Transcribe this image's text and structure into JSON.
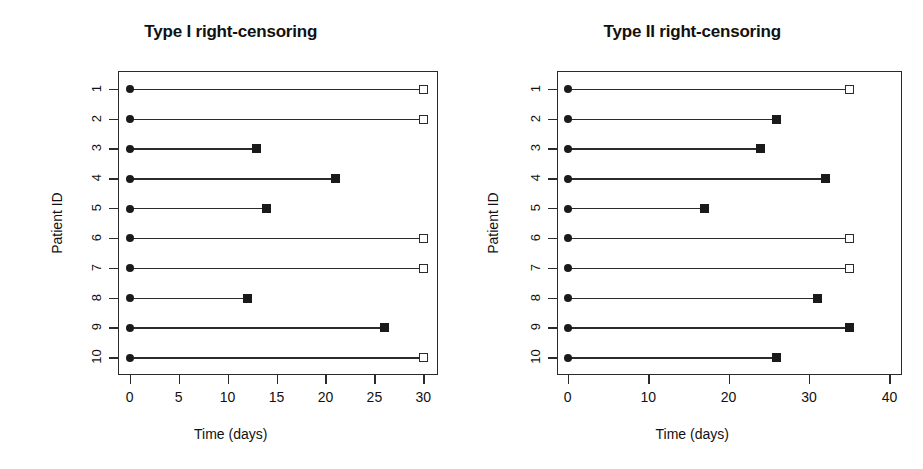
{
  "figure": {
    "background": "#ffffff",
    "foreground": "#1a1a1a"
  },
  "chart_data": [
    {
      "type": "scatter",
      "title": "Type I right-censoring",
      "xlabel": "Time (days)",
      "ylabel": "Patient ID",
      "xlim": [
        -1.2,
        31.5
      ],
      "ylim": [
        0.4,
        10.6
      ],
      "grid": false,
      "legend": "none",
      "xticks": [
        0,
        5,
        10,
        15,
        20,
        25,
        30
      ],
      "xtick_labels": [
        "0",
        "5",
        "10",
        "15",
        "20",
        "25",
        "30"
      ],
      "yticks": [
        1,
        2,
        3,
        4,
        5,
        6,
        7,
        8,
        9,
        10
      ],
      "ytick_labels": [
        "1",
        "2",
        "3",
        "4",
        "5",
        "6",
        "7",
        "8",
        "9",
        "10"
      ],
      "marker_legend": {
        "start": "filled-circle",
        "event": "filled-square",
        "censored": "open-square"
      },
      "series": [
        {
          "name": "Patient 1",
          "patient_id": 1,
          "start": 0,
          "end": 30,
          "status": "censored"
        },
        {
          "name": "Patient 2",
          "patient_id": 2,
          "start": 0,
          "end": 30,
          "status": "censored"
        },
        {
          "name": "Patient 3",
          "patient_id": 3,
          "start": 0,
          "end": 13,
          "status": "event"
        },
        {
          "name": "Patient 4",
          "patient_id": 4,
          "start": 0,
          "end": 21,
          "status": "event"
        },
        {
          "name": "Patient 5",
          "patient_id": 5,
          "start": 0,
          "end": 14,
          "status": "event"
        },
        {
          "name": "Patient 6",
          "patient_id": 6,
          "start": 0,
          "end": 30,
          "status": "censored"
        },
        {
          "name": "Patient 7",
          "patient_id": 7,
          "start": 0,
          "end": 30,
          "status": "censored"
        },
        {
          "name": "Patient 8",
          "patient_id": 8,
          "start": 0,
          "end": 12,
          "status": "event"
        },
        {
          "name": "Patient 9",
          "patient_id": 9,
          "start": 0,
          "end": 26,
          "status": "event"
        },
        {
          "name": "Patient 10",
          "patient_id": 10,
          "start": 0,
          "end": 30,
          "status": "censored"
        }
      ]
    },
    {
      "type": "scatter",
      "title": "Type II right-censoring",
      "xlabel": "Time (days)",
      "ylabel": "Patient ID",
      "xlim": [
        -1.4,
        41.5
      ],
      "ylim": [
        0.4,
        10.6
      ],
      "grid": false,
      "legend": "none",
      "xticks": [
        0,
        10,
        20,
        30,
        40
      ],
      "xtick_labels": [
        "0",
        "10",
        "20",
        "30",
        "40"
      ],
      "yticks": [
        1,
        2,
        3,
        4,
        5,
        6,
        7,
        8,
        9,
        10
      ],
      "ytick_labels": [
        "1",
        "2",
        "3",
        "4",
        "5",
        "6",
        "7",
        "8",
        "9",
        "10"
      ],
      "marker_legend": {
        "start": "filled-circle",
        "event": "filled-square",
        "censored": "open-square"
      },
      "series": [
        {
          "name": "Patient 1",
          "patient_id": 1,
          "start": 0,
          "end": 35,
          "status": "censored"
        },
        {
          "name": "Patient 2",
          "patient_id": 2,
          "start": 0,
          "end": 26,
          "status": "event"
        },
        {
          "name": "Patient 3",
          "patient_id": 3,
          "start": 0,
          "end": 24,
          "status": "event"
        },
        {
          "name": "Patient 4",
          "patient_id": 4,
          "start": 0,
          "end": 32,
          "status": "event"
        },
        {
          "name": "Patient 5",
          "patient_id": 5,
          "start": 0,
          "end": 17,
          "status": "event"
        },
        {
          "name": "Patient 6",
          "patient_id": 6,
          "start": 0,
          "end": 35,
          "status": "censored"
        },
        {
          "name": "Patient 7",
          "patient_id": 7,
          "start": 0,
          "end": 35,
          "status": "censored"
        },
        {
          "name": "Patient 8",
          "patient_id": 8,
          "start": 0,
          "end": 31,
          "status": "event"
        },
        {
          "name": "Patient 9",
          "patient_id": 9,
          "start": 0,
          "end": 35,
          "status": "event"
        },
        {
          "name": "Patient 10",
          "patient_id": 10,
          "start": 0,
          "end": 26,
          "status": "event"
        }
      ]
    }
  ]
}
